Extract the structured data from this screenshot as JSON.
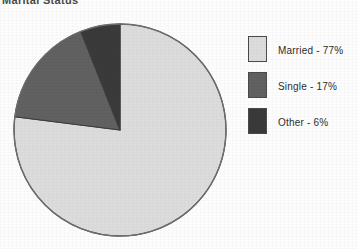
{
  "title": "Marital Status",
  "chart_data": {
    "type": "pie",
    "title": "Marital Status",
    "categories": [
      "Married",
      "Single",
      "Other"
    ],
    "values": [
      77,
      17,
      6
    ],
    "unit": "%",
    "labels": [
      "Married - 77%",
      "Single - 17%",
      "Other - 6%"
    ],
    "colors": [
      "#dcdcdc",
      "#616161",
      "#3a3a3a"
    ],
    "start_angle_deg": 0,
    "direction": "clockwise",
    "legend": "right",
    "grid": false,
    "xlabel": "",
    "ylabel": ""
  },
  "legend": {
    "items": [
      {
        "label": "Married - 77%",
        "color": "#dcdcdc",
        "swatch_name": "legend-swatch-married"
      },
      {
        "label": "Single - 17%",
        "color": "#616161",
        "swatch_name": "legend-swatch-single"
      },
      {
        "label": "Other - 6%",
        "color": "#3a3a3a",
        "swatch_name": "legend-swatch-other"
      }
    ]
  },
  "pie": {
    "center_x": 108,
    "center_y": 108,
    "radius": 106,
    "outline_color": "#6e6e6e"
  }
}
